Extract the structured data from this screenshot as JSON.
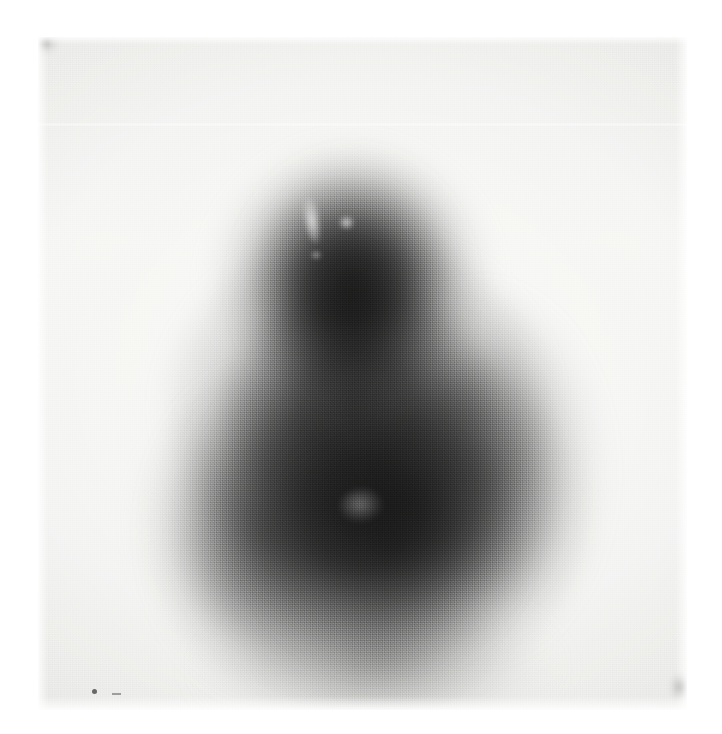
{
  "document": {
    "kind": "scanned-medical-image",
    "modality_hint": "nuclear-medicine-scintigraphy",
    "caption": "",
    "page_background": "#ffffff"
  },
  "plate": {
    "label": "scan-plate",
    "left": 38,
    "top": 37,
    "width": 649,
    "height": 673,
    "background_color": "#f2f2f0",
    "border_style": "feathered-white-margin"
  },
  "palette": {
    "paper_white": "#ffffff",
    "film_base": "#f1f1ef",
    "mid_gray": "#9a9a9a",
    "dark_gray": "#5a5a5a",
    "darkest_core": "#3c3c3c",
    "hotspot_white": "#ffffff"
  },
  "features": {
    "main_mass": {
      "name": "diffuse-uptake-mass",
      "shape": "pear",
      "orientation": "vertical",
      "superior_margin_y": 130,
      "inferior_margin_y": 690,
      "widest_y": 520,
      "left_margin_x": 150,
      "right_margin_x": 560,
      "density_description": "dense homogeneous central core fading radially"
    },
    "hotspots": [
      {
        "name": "upper-vertical-streak",
        "x": 312,
        "y": 207,
        "w": 16,
        "h": 48,
        "intensity": "bright"
      },
      {
        "name": "upper-focal-blob",
        "x": 347,
        "y": 222,
        "w": 17,
        "h": 15,
        "intensity": "bright"
      },
      {
        "name": "upper-minor-focus",
        "x": 318,
        "y": 255,
        "w": 12,
        "h": 10,
        "intensity": "faint"
      },
      {
        "name": "lower-mottled-patch",
        "x": 358,
        "y": 506,
        "w": 44,
        "h": 34,
        "intensity": "faint"
      }
    ],
    "artifacts": [
      {
        "name": "horizontal-scan-line",
        "y": 123,
        "description": "thin pale raster line across full plate width"
      },
      {
        "name": "corner-smudge-top-left",
        "x": 40,
        "y": 39
      },
      {
        "name": "corner-smudge-bottom-right",
        "x": 676,
        "y": 683
      },
      {
        "name": "marker-dot-bottom-left",
        "x": 92,
        "y": 689
      },
      {
        "name": "marker-dash-bottom-left",
        "x": 112,
        "y": 693
      },
      {
        "name": "halftone-screen-texture",
        "description": "regular print dot-screen grain over entire plate"
      }
    ]
  }
}
